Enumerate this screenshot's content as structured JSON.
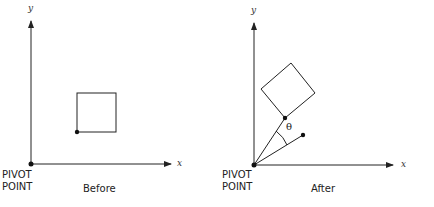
{
  "panels": [
    {
      "caption": "Before",
      "pivot_label_line1": "PIVOT",
      "pivot_label_line2": "POINT",
      "x_axis_label": "x",
      "y_axis_label": "y"
    },
    {
      "caption": "After",
      "pivot_label_line1": "PIVOT",
      "pivot_label_line2": "POINT",
      "x_axis_label": "x",
      "y_axis_label": "y",
      "angle_label": "θ"
    }
  ]
}
